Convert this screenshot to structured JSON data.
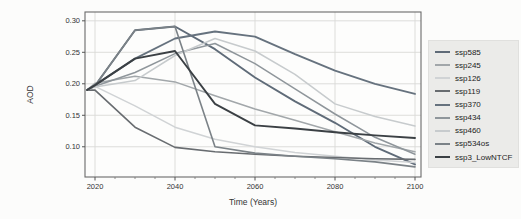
{
  "figure": {
    "xlabel": "Time (Years)",
    "ylabel": "AOD"
  },
  "chart_data": {
    "type": "line",
    "title": "",
    "xlabel": "Time (Years)",
    "ylabel": "AOD",
    "grid": true,
    "legend_position": "right-outside",
    "x": [
      2018,
      2020,
      2030,
      2040,
      2050,
      2060,
      2070,
      2080,
      2090,
      2100
    ],
    "xlim": [
      2017.5,
      2101.5
    ],
    "ylim": [
      0.052,
      0.314
    ],
    "x_ticks": [
      2020,
      2040,
      2060,
      2080,
      2100
    ],
    "x_tick_labels": [
      "2020",
      "2040",
      "2060",
      "2080",
      "2100"
    ],
    "x_minor_tick_step": 5,
    "y_ticks": [
      0.3,
      0.25,
      0.2,
      0.15,
      0.1
    ],
    "y_tick_labels": [
      "0.30",
      "0.25",
      "0.20",
      "0.15",
      "0.10"
    ],
    "frame_color": "#6a6a6a",
    "grid_color": "#d9d9d7",
    "series": [
      {
        "name": "ssp585",
        "color": "#5f6b78",
        "width": 1.9,
        "values": [
          0.19,
          0.197,
          0.285,
          0.291,
          0.255,
          0.21,
          0.172,
          0.138,
          0.1,
          0.072
        ]
      },
      {
        "name": "ssp245",
        "color": "#a2a7aa",
        "width": 1.5,
        "values": [
          0.19,
          0.201,
          0.212,
          0.203,
          0.181,
          0.16,
          0.142,
          0.124,
          0.106,
          0.092
        ]
      },
      {
        "name": "ssp126",
        "color": "#d0d3d5",
        "width": 1.5,
        "values": [
          0.19,
          0.196,
          0.165,
          0.131,
          0.112,
          0.1,
          0.091,
          0.085,
          0.079,
          0.075
        ]
      },
      {
        "name": "ssp119",
        "color": "#686c70",
        "width": 1.6,
        "values": [
          0.19,
          0.19,
          0.131,
          0.099,
          0.092,
          0.088,
          0.085,
          0.083,
          0.081,
          0.08
        ]
      },
      {
        "name": "ssp370",
        "color": "#66727e",
        "width": 1.9,
        "values": [
          0.19,
          0.198,
          0.24,
          0.272,
          0.283,
          0.275,
          0.247,
          0.221,
          0.2,
          0.184
        ]
      },
      {
        "name": "ssp434",
        "color": "#8f969b",
        "width": 1.5,
        "values": [
          0.19,
          0.196,
          0.218,
          0.248,
          0.264,
          0.232,
          0.192,
          0.152,
          0.115,
          0.088
        ]
      },
      {
        "name": "ssp460",
        "color": "#c7cbcd",
        "width": 1.5,
        "values": [
          0.19,
          0.195,
          0.205,
          0.245,
          0.272,
          0.252,
          0.215,
          0.168,
          0.148,
          0.133
        ]
      },
      {
        "name": "ssp534os",
        "color": "#7b8287",
        "width": 1.6,
        "values": [
          0.19,
          0.197,
          0.285,
          0.291,
          0.1,
          0.09,
          0.085,
          0.081,
          0.076,
          0.068
        ]
      },
      {
        "name": "ssp3_LowNTCF",
        "color": "#3b4044",
        "width": 1.9,
        "values": [
          0.19,
          0.198,
          0.24,
          0.252,
          0.168,
          0.134,
          0.129,
          0.123,
          0.118,
          0.114
        ]
      }
    ]
  }
}
